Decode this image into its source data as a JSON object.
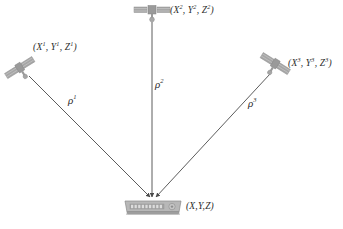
{
  "diagram": {
    "type": "satellite-trilateration",
    "title": "",
    "background_color": "#ffffff",
    "line_color": "#4a4a4a",
    "satellite_color": "#a6a6a6",
    "receiver_color": "#b3b3b3",
    "text_color": "#2b2b2b"
  },
  "satellites": [
    {
      "id": "satellite-1",
      "label": "(X1, Y1, Z1)",
      "label_parts": {
        "x": "X",
        "xs": "1",
        "y": "Y",
        "ys": "1",
        "z": "Z",
        "zs": "1"
      },
      "position": {
        "x": 20,
        "y": 68
      },
      "label_position": {
        "x": 34,
        "y": 44
      },
      "orientation": "tilted-right"
    },
    {
      "id": "satellite-2",
      "label": "(X2, Y2, Z2)",
      "label_parts": {
        "x": "X",
        "xs": "2",
        "y": "Y",
        "ys": "2",
        "z": "Z",
        "zs": "2"
      },
      "position": {
        "x": 152,
        "y": 13
      },
      "label_position": {
        "x": 171,
        "y": 4
      },
      "orientation": "horizontal"
    },
    {
      "id": "satellite-3",
      "label": "(X3, Y3, Z3)",
      "label_parts": {
        "x": "X",
        "xs": "3",
        "y": "Y",
        "ys": "3",
        "z": "Z",
        "zs": "3"
      },
      "position": {
        "x": 274,
        "y": 65
      },
      "label_position": {
        "x": 289,
        "y": 58
      },
      "orientation": "tilted-left"
    }
  ],
  "receiver": {
    "id": "receiver",
    "label": "(X,Y,Z)",
    "position": {
      "x": 152,
      "y": 207
    },
    "label_position": {
      "x": 183,
      "y": 201
    }
  },
  "ranges": [
    {
      "id": "range-1",
      "symbol": "ρ",
      "superscript": "1",
      "from": "satellite-1",
      "to": "receiver",
      "label_position": {
        "x": 70,
        "y": 97
      }
    },
    {
      "id": "range-2",
      "symbol": "ρ",
      "superscript": "2",
      "from": "satellite-2",
      "to": "receiver",
      "label_position": {
        "x": 156,
        "y": 80
      }
    },
    {
      "id": "range-3",
      "symbol": "ρ",
      "superscript": "3",
      "from": "satellite-3",
      "to": "receiver",
      "label_position": {
        "x": 249,
        "y": 99
      }
    }
  ]
}
